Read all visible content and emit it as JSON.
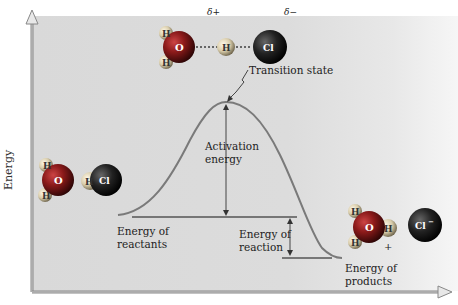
{
  "diagram": {
    "axes": {
      "y_label": "Energy",
      "x_label": ""
    },
    "labels": {
      "transition_state": "Transition state",
      "activation_energy_line1": "Activation",
      "activation_energy_line2": "energy",
      "energy_reactants_line1": "Energy of",
      "energy_reactants_line2": "reactants",
      "energy_reaction_line1": "Energy of",
      "energy_reaction_line2": "reaction",
      "energy_products_line1": "Energy of",
      "energy_products_line2": "products"
    },
    "molecules": {
      "reactants": [
        {
          "name": "water",
          "atoms": [
            "H",
            "O",
            "H"
          ]
        },
        {
          "name": "hydrogen-chloride",
          "atoms": [
            "H",
            "Cl"
          ]
        }
      ],
      "transition_state": {
        "atoms": [
          "H",
          "O",
          "H",
          "H",
          "Cl"
        ],
        "delta_plus": "δ+",
        "delta_minus": "δ−"
      },
      "products": [
        {
          "name": "hydronium",
          "atoms": [
            "H",
            "O",
            "H",
            "H"
          ],
          "charge": "+"
        },
        {
          "name": "chloride",
          "atoms": [
            "Cl"
          ],
          "charge": "−"
        }
      ]
    },
    "atom_symbols": {
      "H": "H",
      "O": "O",
      "Cl": "Cl",
      "Cl_minus": "Cl⁻"
    },
    "colors": {
      "curve": "#7a7a7a",
      "levels": "#555555",
      "panel": "#d9d9d9",
      "axis": "#888888",
      "oxygen": "#8b1a1a",
      "chlorine": "#1f1f1f",
      "hydrogen": "#e8e2d0"
    }
  }
}
